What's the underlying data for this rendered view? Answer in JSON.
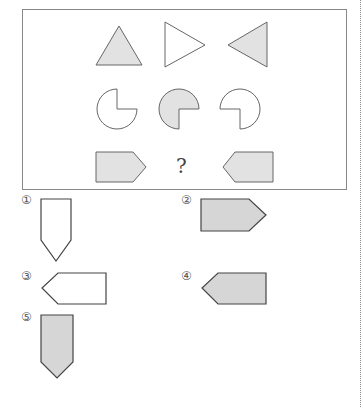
{
  "puzzle": {
    "question_mark": "?",
    "grid": [
      [
        "triangle-up-filled",
        "triangle-right-outline",
        "triangle-left-filled"
      ],
      [
        "circle-missing-top-right-outline",
        "circle-missing-bottom-right-filled",
        "circle-missing-bottom-left-outline"
      ],
      [
        "pentagon-arrow-right-filled",
        "?",
        "pentagon-arrow-left-filled"
      ]
    ]
  },
  "options": [
    {
      "label": "①",
      "shape": "pentagon-arrow-down-outline"
    },
    {
      "label": "②",
      "shape": "pentagon-arrow-right-filled"
    },
    {
      "label": "③",
      "shape": "pentagon-arrow-left-outline"
    },
    {
      "label": "④",
      "shape": "pentagon-arrow-left-filled"
    },
    {
      "label": "⑤",
      "shape": "pentagon-arrow-down-filled"
    }
  ],
  "colors": {
    "fill": "#e2e2e2",
    "option_fill": "#d6d6d6",
    "stroke": "#666666",
    "option_stroke": "#444444"
  }
}
